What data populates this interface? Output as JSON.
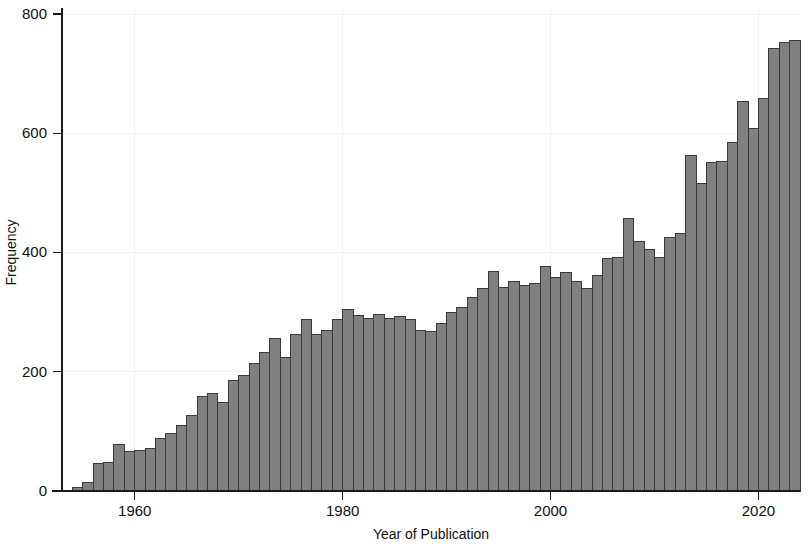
{
  "chart_data": {
    "type": "bar",
    "title": "",
    "subtitle": "",
    "xlabel": "Year of Publication",
    "ylabel": "Frequency",
    "xlim": [
      1953,
      2024
    ],
    "ylim": [
      0,
      800
    ],
    "xticks": [
      1960,
      1980,
      2000,
      2020
    ],
    "yticks": [
      0,
      200,
      400,
      600,
      800
    ],
    "grid": true,
    "legend": null,
    "bar_color": "#808080",
    "bar_edge_color": "#3b3b3b",
    "background_color": "#ffffff",
    "axis_color": "#1a1a1a",
    "gridline_color": "#f2f2f2",
    "categories": [
      1954,
      1955,
      1956,
      1957,
      1958,
      1959,
      1960,
      1961,
      1962,
      1963,
      1964,
      1965,
      1966,
      1967,
      1968,
      1969,
      1970,
      1971,
      1972,
      1973,
      1974,
      1975,
      1976,
      1977,
      1978,
      1979,
      1980,
      1981,
      1982,
      1983,
      1984,
      1985,
      1986,
      1987,
      1988,
      1989,
      1990,
      1991,
      1992,
      1993,
      1994,
      1995,
      1996,
      1997,
      1998,
      1999,
      2000,
      2001,
      2002,
      2003,
      2004,
      2005,
      2006,
      2007,
      2008,
      2009,
      2010,
      2011,
      2012,
      2013,
      2014,
      2015,
      2016,
      2017,
      2018,
      2019,
      2020,
      2021,
      2022,
      2023
    ],
    "values": [
      6,
      14,
      46,
      48,
      78,
      66,
      68,
      72,
      88,
      96,
      110,
      126,
      158,
      163,
      148,
      186,
      194,
      214,
      232,
      256,
      224,
      262,
      288,
      263,
      270,
      288,
      304,
      294,
      290,
      296,
      290,
      293,
      288,
      270,
      268,
      281,
      300,
      308,
      325,
      339,
      368,
      342,
      352,
      345,
      348,
      377,
      358,
      366,
      352,
      340,
      362,
      390,
      392,
      457,
      419,
      405,
      392,
      425,
      432,
      563,
      515,
      551,
      553,
      585,
      653,
      608,
      658,
      742,
      752,
      756
    ],
    "value_unit": "publications",
    "bar_count": 70
  }
}
